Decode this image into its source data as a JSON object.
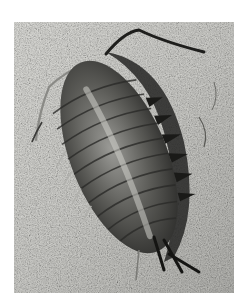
{
  "image": {
    "subject": "isopod",
    "description": "Black-and-white photograph of a segmented isopod crustacean crawling diagonally on a speckled sandy rock surface, with long antennae at top and tail appendages at bottom",
    "colors": {
      "frame_background": "#ffffff",
      "surface_light": "#dcdcd8",
      "surface_mid": "#b8b8b4",
      "body_dark": "#3a3a38",
      "body_mid": "#6e6e6a",
      "body_highlight": "#c8c8c4",
      "shadow": "#1c1c1a"
    }
  }
}
